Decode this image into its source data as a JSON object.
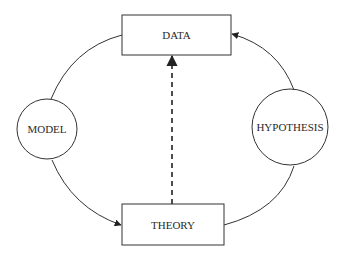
{
  "diagram": {
    "nodes": {
      "data": {
        "label": "DATA",
        "shape": "rectangle"
      },
      "theory": {
        "label": "THEORY",
        "shape": "rectangle"
      },
      "model": {
        "label": "MODEL",
        "shape": "circle"
      },
      "hypothesis": {
        "label": "HYPOTHESIS",
        "shape": "circle"
      }
    },
    "edges": [
      {
        "from": "model",
        "to": "data",
        "style": "solid",
        "arrow": false
      },
      {
        "from": "model",
        "to": "theory",
        "style": "solid",
        "arrow": true
      },
      {
        "from": "hypothesis",
        "to": "data",
        "style": "solid",
        "arrow": true
      },
      {
        "from": "theory",
        "to": "hypothesis",
        "style": "solid",
        "arrow": false
      },
      {
        "from": "theory",
        "to": "data",
        "style": "dashed",
        "arrow": true
      }
    ],
    "colors": {
      "stroke": "#333333",
      "background": "#ffffff"
    }
  }
}
